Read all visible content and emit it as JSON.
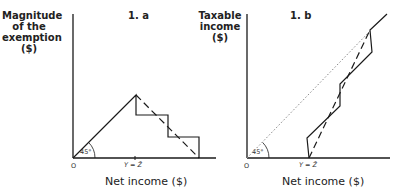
{
  "panel_a": {
    "title": "1. a",
    "y_label_lines": [
      "Magnitude",
      "of the",
      "exemption",
      "($)"
    ],
    "x_label": "Net income ($)",
    "origin": "O",
    "tick_label": "Y = Z̄",
    "angle_label": "45°"
  },
  "panel_b": {
    "title": "1. b",
    "y_label_lines": [
      "Taxable",
      "income",
      "($)"
    ],
    "x_label": "Net income ($)",
    "origin": "O",
    "tick_label": "Y = Z̄",
    "angle_label": "45°"
  }
}
